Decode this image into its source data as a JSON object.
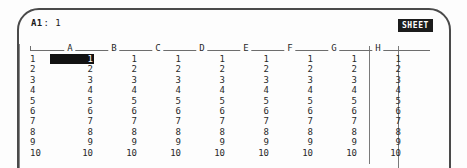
{
  "device": {
    "bezel_color": "#4a4a4a",
    "screen_bg": "#fdfdfd",
    "text_color": "#2a2a2a"
  },
  "status": {
    "cell_ref": "A1",
    "separator": ":",
    "cell_value": "1"
  },
  "mode": {
    "badge_label": "SHEET",
    "badge_bg": "#1c1c1c",
    "badge_fg": "#ffffff"
  },
  "grid": {
    "columns": [
      "A",
      "B",
      "C",
      "D",
      "E",
      "F",
      "G",
      "H"
    ],
    "row_numbers": [
      "1",
      "2",
      "3",
      "4",
      "5",
      "6",
      "7",
      "8",
      "9",
      "10"
    ],
    "selected_cell": "A1",
    "rows": [
      [
        "1",
        "1",
        "1",
        "1",
        "1",
        "1",
        "1",
        "1"
      ],
      [
        "2",
        "2",
        "2",
        "2",
        "2",
        "2",
        "2",
        "2"
      ],
      [
        "3",
        "3",
        "3",
        "3",
        "3",
        "3",
        "3",
        "3"
      ],
      [
        "4",
        "4",
        "4",
        "4",
        "4",
        "4",
        "4",
        "4"
      ],
      [
        "5",
        "5",
        "5",
        "5",
        "5",
        "5",
        "5",
        "5"
      ],
      [
        "6",
        "6",
        "6",
        "6",
        "6",
        "6",
        "6",
        "6"
      ],
      [
        "7",
        "7",
        "7",
        "7",
        "7",
        "7",
        "7",
        "7"
      ],
      [
        "8",
        "8",
        "8",
        "8",
        "8",
        "8",
        "8",
        "8"
      ],
      [
        "9",
        "9",
        "9",
        "9",
        "9",
        "9",
        "9",
        "9"
      ],
      [
        "10",
        "10",
        "10",
        "10",
        "10",
        "10",
        "10",
        "10"
      ]
    ]
  }
}
